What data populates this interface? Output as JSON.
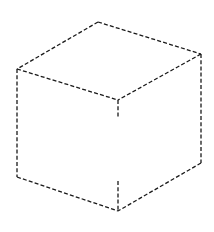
{
  "diagram": {
    "type": "dashed-isometric-cube",
    "stroke_color": "#1a1a1a",
    "background_color": "#ffffff",
    "vertices": {
      "top": [
        98,
        22
      ],
      "left_top": [
        17,
        69
      ],
      "right_top": [
        201,
        54
      ],
      "front_top": [
        118,
        100
      ],
      "left_bottom": [
        17,
        177
      ],
      "right_bottom": [
        201,
        163
      ],
      "front_bottom": [
        118,
        211
      ]
    },
    "edges": [
      {
        "name": "top-left-back-edge",
        "from": "top",
        "to": "left_top"
      },
      {
        "name": "top-right-back-edge",
        "from": "top",
        "to": "right_top"
      },
      {
        "name": "top-left-front-edge",
        "from": "left_top",
        "to": "front_top"
      },
      {
        "name": "top-right-front-edge",
        "from": "right_top",
        "to": "front_top"
      },
      {
        "name": "left-vertical-edge",
        "from": "left_top",
        "to": "left_bottom"
      },
      {
        "name": "right-vertical-edge",
        "from": "right_top",
        "to": "right_bottom"
      },
      {
        "name": "bottom-left-edge",
        "from": "left_bottom",
        "to": "front_bottom"
      },
      {
        "name": "bottom-right-edge",
        "from": "right_bottom",
        "to": "front_bottom"
      }
    ],
    "partial_edges": [
      {
        "name": "front-vertical-edge-upper-stub",
        "from": [
          118,
          100
        ],
        "to": [
          118,
          118
        ]
      },
      {
        "name": "front-vertical-edge-lower-stub",
        "from": [
          118,
          181
        ],
        "to": [
          118,
          211
        ]
      }
    ]
  }
}
